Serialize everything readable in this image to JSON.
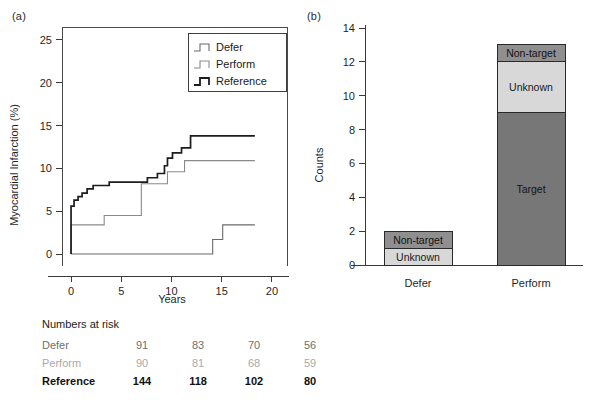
{
  "figure": {
    "panel_a_label": "(a)",
    "panel_b_label": "(b)"
  },
  "panel_a": {
    "ylabel": "Myocardial Infarction (%)",
    "xlabel": "Years",
    "yticks": [
      "0",
      "5",
      "10",
      "15",
      "20",
      "25"
    ],
    "xticks": [
      "0",
      "5",
      "10",
      "15",
      "20"
    ],
    "legend": {
      "items": [
        {
          "label": "Defer",
          "color": "#6b6b6b"
        },
        {
          "label": "Perform",
          "color": "#8a8a8a"
        },
        {
          "label": "Reference",
          "color": "#1c1c1c"
        }
      ]
    },
    "risk_table": {
      "title": "Numbers at risk",
      "rows": [
        {
          "name": "Defer",
          "values": [
            "91",
            "83",
            "70",
            "56"
          ]
        },
        {
          "name": "Perform",
          "values": [
            "90",
            "81",
            "68",
            "59"
          ]
        },
        {
          "name": "Reference",
          "values": [
            "144",
            "118",
            "102",
            "80"
          ]
        }
      ]
    }
  },
  "panel_b": {
    "ylabel": "Counts",
    "yticks": [
      "0",
      "2",
      "4",
      "6",
      "8",
      "10",
      "12",
      "14"
    ],
    "categories": [
      "Defer",
      "Perform"
    ],
    "segment_labels": {
      "target": "Target",
      "unknown": "Unknown",
      "non_target": "Non-target"
    }
  },
  "chart_data": [
    {
      "type": "line",
      "title": "(a) Kaplan-Meier cumulative Myocardial Infarction",
      "xlabel": "Years",
      "ylabel": "Myocardial Infarction (%)",
      "xlim": [
        -0.9,
        21.5
      ],
      "ylim": [
        -1.4,
        26.5
      ],
      "xticks": [
        0,
        5,
        10,
        15,
        20
      ],
      "yticks": [
        0,
        5,
        10,
        15,
        20,
        25
      ],
      "grid": false,
      "legend_position": "top-right",
      "step_type": "post",
      "series": [
        {
          "name": "Defer",
          "color": "#6b6b6b",
          "x": [
            0,
            0,
            3.3,
            3.3,
            7.0,
            7.0,
            14.1,
            14.1,
            15.1,
            15.1,
            18.3
          ],
          "y": [
            0,
            0,
            0,
            0,
            0,
            0,
            0,
            1.7,
            1.7,
            3.4,
            3.4
          ]
        },
        {
          "name": "Perform",
          "color": "#8a8a8a",
          "x": [
            0,
            0,
            3.3,
            3.3,
            7.0,
            7.0,
            9.0,
            9.0,
            9.6,
            9.6,
            10.6,
            10.6,
            11.3,
            11.3,
            18.3
          ],
          "y": [
            0,
            3.4,
            3.4,
            4.5,
            4.5,
            8.2,
            8.2,
            8.2,
            8.2,
            9.6,
            9.6,
            9.6,
            9.6,
            10.9,
            10.9
          ]
        },
        {
          "name": "Reference",
          "color": "#1c1c1c",
          "x": [
            0,
            0,
            0.3,
            0.3,
            0.7,
            0.7,
            1.1,
            1.1,
            1.6,
            1.6,
            2.2,
            2.2,
            3.8,
            3.8,
            7.6,
            7.6,
            8.6,
            8.6,
            9.3,
            9.3,
            9.6,
            9.6,
            10.1,
            10.1,
            11.0,
            11.0,
            11.9,
            11.9,
            18.3
          ],
          "y": [
            0,
            5.6,
            5.6,
            6.3,
            6.3,
            6.7,
            6.7,
            7.1,
            7.1,
            7.6,
            7.6,
            8.0,
            8.0,
            8.4,
            8.4,
            8.9,
            8.9,
            9.4,
            9.4,
            10.3,
            10.3,
            11.2,
            11.2,
            11.8,
            11.8,
            12.4,
            12.4,
            13.8,
            13.8
          ]
        }
      ],
      "numbers_at_risk": {
        "time_points": [
          0,
          5,
          10,
          15
        ],
        "rows": [
          {
            "name": "Defer",
            "values": [
              91,
              83,
              70,
              56
            ]
          },
          {
            "name": "Perform",
            "values": [
              90,
              81,
              68,
              59
            ]
          },
          {
            "name": "Reference",
            "values": [
              144,
              118,
              102,
              80
            ]
          }
        ]
      }
    },
    {
      "type": "bar",
      "subtype": "stacked",
      "title": "(b) Counts by lesion type",
      "xlabel": "",
      "ylabel": "Counts",
      "categories": [
        "Defer",
        "Perform"
      ],
      "ylim": [
        0,
        14
      ],
      "yticks": [
        0,
        2,
        4,
        6,
        8,
        10,
        12,
        14
      ],
      "grid": false,
      "series": [
        {
          "name": "Target",
          "values": [
            0,
            9
          ],
          "color": "#777777"
        },
        {
          "name": "Unknown",
          "values": [
            1,
            3
          ],
          "color": "#d8d8d8"
        },
        {
          "name": "Non-target",
          "values": [
            1,
            1
          ],
          "color": "#8f8f8f"
        }
      ],
      "totals": [
        2,
        13
      ]
    }
  ]
}
